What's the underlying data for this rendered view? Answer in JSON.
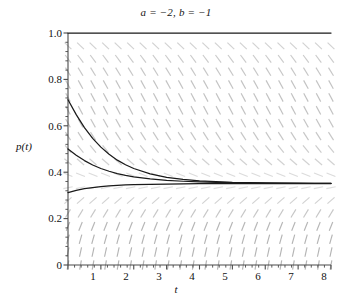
{
  "chart_data": {
    "type": "line",
    "title": "a = −2, b = −1",
    "xlabel": "t",
    "ylabel": "p(t)",
    "xlim": [
      0,
      8
    ],
    "ylim": [
      0,
      1.0
    ],
    "grid": false,
    "legend": null,
    "x_ticks": [
      0,
      1,
      2,
      3,
      4,
      5,
      6,
      7,
      8
    ],
    "x_tick_labels": [
      "",
      "1",
      "2",
      "3",
      "4",
      "5",
      "6",
      "7",
      "8"
    ],
    "y_ticks": [
      0,
      0.2,
      0.4,
      0.6,
      0.8,
      1.0
    ],
    "y_tick_labels": [
      "0",
      "0.2",
      "0.4",
      "0.6",
      "0.8",
      "1.0"
    ],
    "equilibrium": 0.3512,
    "model": "dp/dt = a*p + b*p^2 style logistic-like decay toward equilibrium 0.3512",
    "slope_field": {
      "present": true,
      "color": "#9a9a9a",
      "columns": 21,
      "rows": 18,
      "description": "short gray dashes; negative slope above p=0.35, positive slope below p=0.35, flat at equilibrium"
    },
    "series": [
      {
        "name": "solution-upper",
        "color": "#1a1a1a",
        "p0": 0.712,
        "points_t": [
          0,
          0.25,
          0.5,
          0.75,
          1,
          1.25,
          1.5,
          1.75,
          2,
          2.5,
          3,
          3.5,
          4,
          4.5,
          5,
          5.5,
          6,
          6.5,
          7,
          7.5,
          8
        ],
        "points_p": [
          0.712,
          0.648,
          0.592,
          0.546,
          0.508,
          0.477,
          0.452,
          0.432,
          0.416,
          0.393,
          0.378,
          0.369,
          0.363,
          0.359,
          0.356,
          0.355,
          0.354,
          0.353,
          0.353,
          0.352,
          0.352
        ]
      },
      {
        "name": "solution-middle",
        "color": "#1a1a1a",
        "p0": 0.5,
        "points_t": [
          0,
          0.25,
          0.5,
          0.75,
          1,
          1.25,
          1.5,
          1.75,
          2,
          2.5,
          3,
          3.5,
          4,
          4.5,
          5,
          5.5,
          6,
          6.5,
          7,
          7.5,
          8
        ],
        "points_p": [
          0.5,
          0.473,
          0.45,
          0.431,
          0.416,
          0.404,
          0.394,
          0.386,
          0.38,
          0.371,
          0.365,
          0.361,
          0.358,
          0.356,
          0.355,
          0.354,
          0.353,
          0.353,
          0.352,
          0.352,
          0.352
        ]
      },
      {
        "name": "solution-lower",
        "color": "#1a1a1a",
        "p0": 0.312,
        "points_t": [
          0,
          0.25,
          0.5,
          0.75,
          1,
          1.25,
          1.5,
          1.75,
          2,
          2.5,
          3,
          3.5,
          4,
          4.5,
          5,
          5.5,
          6,
          6.5,
          7,
          7.5,
          8
        ],
        "points_p": [
          0.312,
          0.322,
          0.329,
          0.334,
          0.338,
          0.341,
          0.343,
          0.345,
          0.346,
          0.348,
          0.349,
          0.35,
          0.351,
          0.351,
          0.351,
          0.351,
          0.351,
          0.351,
          0.351,
          0.351,
          0.351
        ]
      },
      {
        "name": "solution-top-boundary",
        "color": "#1a1a1a",
        "p0": 1.0,
        "points_t": [
          0,
          8
        ],
        "points_p": [
          1.0,
          1.0
        ]
      }
    ]
  },
  "axes": {
    "y_labels": [
      "1.0",
      "0.8",
      "0.6",
      "0.4",
      "0.2",
      "0"
    ],
    "x_labels": [
      "1",
      "2",
      "3",
      "4",
      "5",
      "6",
      "7",
      "8"
    ],
    "y_title": "p(t)",
    "x_title": "t"
  },
  "header": {
    "title": "a = −2, b = −1"
  },
  "colors": {
    "curve": "#1a1a1a",
    "field": "#9a9a9a",
    "axis": "#4a4a4a",
    "text": "#111111",
    "background": "#ffffff"
  }
}
